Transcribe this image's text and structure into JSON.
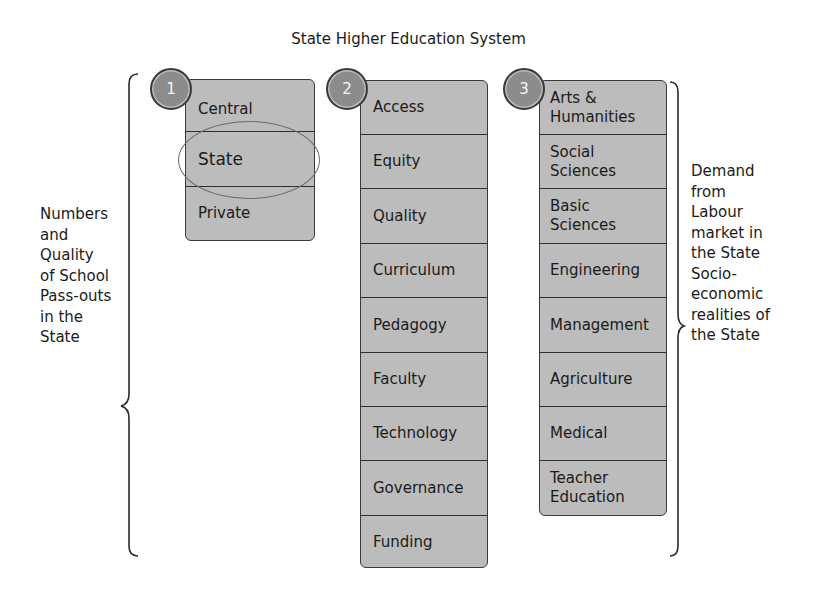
{
  "title": "State Higher Education System",
  "left_label": [
    "Numbers",
    "and",
    "Quality",
    "of School",
    "Pass-outs",
    "in the",
    "State"
  ],
  "right_label": [
    "Demand",
    "from",
    "Labour",
    "market in",
    "the State",
    "Socio-",
    "economic",
    "realities of",
    "the State"
  ],
  "columns": [
    {
      "badge": "1",
      "highlighted_item": "State",
      "items": [
        "Central",
        "State",
        "Private"
      ]
    },
    {
      "badge": "2",
      "items": [
        "Access",
        "Equity",
        "Quality",
        "Curriculum",
        "Pedagogy",
        "Faculty",
        "Technology",
        "Governance",
        "Funding"
      ]
    },
    {
      "badge": "3",
      "items": [
        [
          "Arts &",
          "Humanities"
        ],
        [
          "Social",
          "Sciences"
        ],
        [
          "Basic",
          "Sciences"
        ],
        [
          "Engineering"
        ],
        [
          "Management"
        ],
        [
          "Agriculture"
        ],
        [
          "Medical"
        ],
        [
          "Teacher",
          "Education"
        ]
      ]
    }
  ],
  "colors": {
    "box_fill": "#bcbcbc",
    "badge_fill": "#8c8c8c",
    "border": "#3a3a3a",
    "text": "#1a1a1a"
  }
}
